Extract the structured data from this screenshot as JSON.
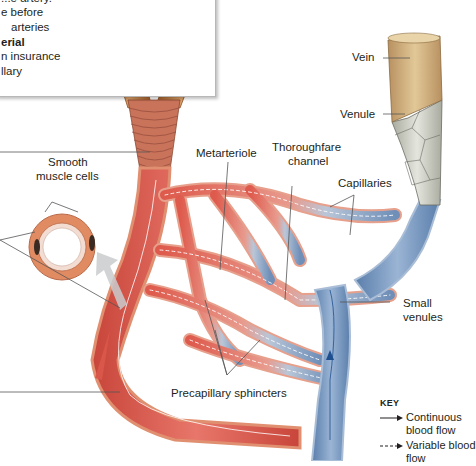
{
  "callout": {
    "lines": [
      {
        "text": "...e artery.",
        "bold": false
      },
      {
        "text": "e before",
        "bold": false
      },
      {
        "text": "arteries",
        "bold": false
      },
      {
        "text": "erial",
        "bold": true
      },
      {
        "text": "n insurance",
        "bold": false
      },
      {
        "text": "llary",
        "bold": false
      }
    ]
  },
  "labels": {
    "vein": "Vein",
    "venule": "Venule",
    "metarteriole": "Metarteriole",
    "thoroughfare_channel_1": "Thoroughfare",
    "thoroughfare_channel_2": "channel",
    "capillaries": "Capillaries",
    "smooth_muscle_1": "Smooth",
    "smooth_muscle_2": "muscle cells",
    "small_venules_1": "Small",
    "small_venules_2": "venules",
    "precapillary_sphincters": "Precapillary sphincters"
  },
  "key": {
    "title": "KEY",
    "items": [
      {
        "style": "solid",
        "label": "Continuous blood flow"
      },
      {
        "style": "dashed",
        "label": "Variable blood flow"
      }
    ]
  },
  "colors": {
    "arterial": "#d9564a",
    "arterial_light": "#f0a48f",
    "arterial_wall": "#e0896a",
    "venous": "#6f8fb8",
    "venous_light": "#a8c0dc",
    "venule_wall": "#c9cbc2",
    "vein_tan": "#c9a06a",
    "artery_tan": "#c07a3c",
    "leader": "#555555"
  }
}
